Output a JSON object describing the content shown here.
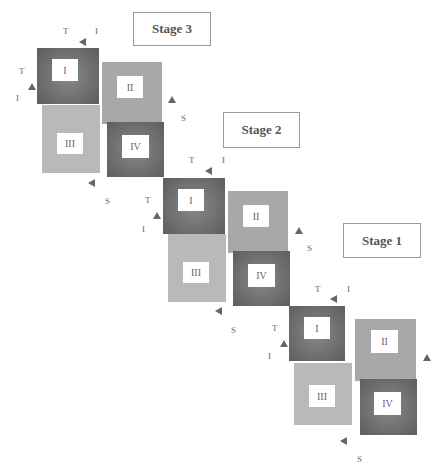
{
  "diagram": {
    "stages": [
      {
        "label": "Stage 3",
        "boxes": {
          "one": "I",
          "two": "II",
          "three": "III",
          "four": "IV"
        },
        "letters": {
          "top_t": "T",
          "top_i": "I",
          "left_t": "T",
          "left_i": "I",
          "right_s": "S"
        }
      },
      {
        "label": "Stage 2",
        "boxes": {
          "one": "I",
          "two": "II",
          "three": "III",
          "four": "IV"
        },
        "letters": {
          "top_t": "T",
          "top_i": "I",
          "left_t": "T",
          "left_i": "I",
          "right_s": "S",
          "bottom_s": "S"
        }
      },
      {
        "label": "Stage 1",
        "boxes": {
          "one": "I",
          "two": "II",
          "three": "III",
          "four": "IV"
        },
        "letters": {
          "top_t": "T",
          "top_i": "I",
          "left_t": "T",
          "left_i": "I",
          "bottom_s": "S",
          "bottom_s2": "S"
        }
      }
    ]
  }
}
